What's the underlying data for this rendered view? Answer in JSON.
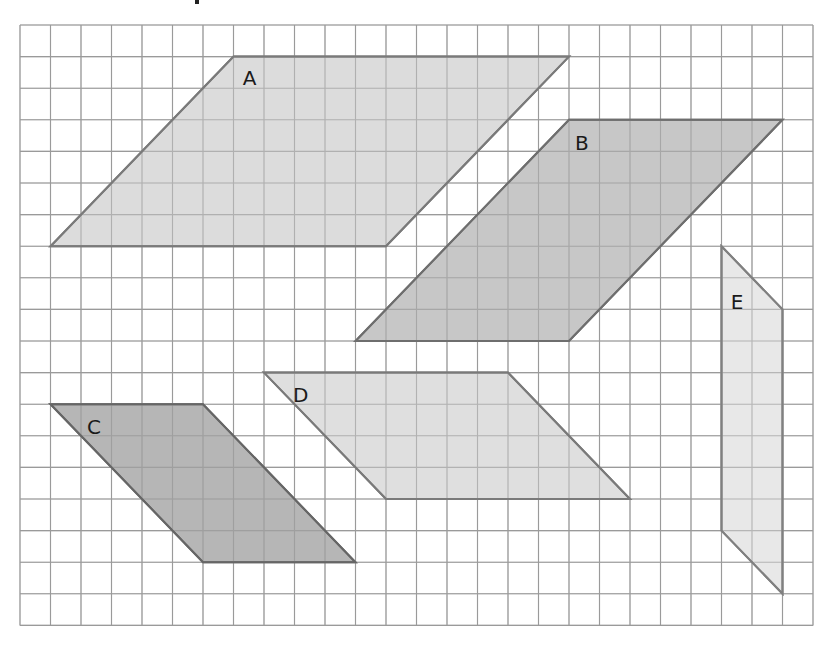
{
  "figure": {
    "background": "#ffffff",
    "grid": {
      "origin_x": 20,
      "origin_y": 25,
      "cell_w": 30.5,
      "cell_h": 31.6,
      "cols": 26,
      "rows": 19,
      "line_color": "#9a9a9a"
    },
    "shapes": [
      {
        "label": "A",
        "fill": "#d6d6d6",
        "stroke": "#7a7a7a",
        "points": [
          [
            7,
            1
          ],
          [
            18,
            1
          ],
          [
            12,
            7
          ],
          [
            1,
            7
          ]
        ],
        "label_pos": [
          7.3,
          1.7
        ]
      },
      {
        "label": "B",
        "fill": "#bdbdbd",
        "stroke": "#6e6e6e",
        "points": [
          [
            18,
            3
          ],
          [
            25,
            3
          ],
          [
            18,
            10
          ],
          [
            11,
            10
          ]
        ],
        "label_pos": [
          18.2,
          3.75
        ]
      },
      {
        "label": "C",
        "fill": "#a9a9a9",
        "stroke": "#666666",
        "points": [
          [
            1,
            12
          ],
          [
            6,
            12
          ],
          [
            11,
            17
          ],
          [
            6,
            17
          ]
        ],
        "label_pos": [
          2.2,
          12.75
        ]
      },
      {
        "label": "D",
        "fill": "#d9d9d9",
        "stroke": "#7a7a7a",
        "points": [
          [
            8,
            11
          ],
          [
            16,
            11
          ],
          [
            20,
            15
          ],
          [
            12,
            15
          ]
        ],
        "label_pos": [
          8.95,
          11.75
        ]
      },
      {
        "label": "E",
        "fill": "#e4e4e4",
        "stroke": "#808080",
        "points": [
          [
            23,
            7
          ],
          [
            25,
            9
          ],
          [
            25,
            18
          ],
          [
            23,
            16
          ]
        ],
        "label_pos": [
          23.3,
          8.8
        ]
      }
    ]
  }
}
